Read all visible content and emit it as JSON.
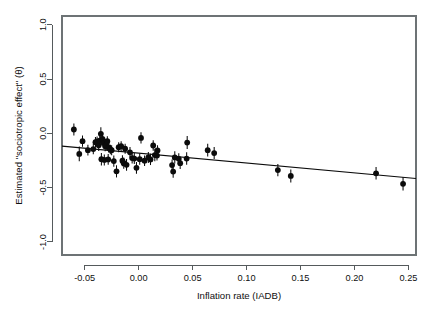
{
  "chart_data": {
    "type": "scatter",
    "title": "",
    "xlabel": "Inflation rate (IADB)",
    "ylabel": "Estimated \"sociotropic effect\" (θ)",
    "xlim": [
      -0.071,
      0.257
    ],
    "ylim": [
      -1.12,
      1.08
    ],
    "xticks": [
      -0.05,
      0.0,
      0.05,
      0.1,
      0.15,
      0.2,
      0.25
    ],
    "xtick_labels": [
      "-0.05",
      "0.00",
      "0.05",
      "0.10",
      "0.15",
      "0.20",
      "0.25"
    ],
    "yticks": [
      -1.0,
      -0.5,
      0.0,
      0.5,
      1.0
    ],
    "ytick_labels": [
      "-1.0",
      "-0.5",
      "0.0",
      "0.5",
      "1.0"
    ],
    "grid": false,
    "legend": "none",
    "point_color": "#0b0b0b",
    "line_color": "#0b0b0b",
    "frame_color": "#6d7375",
    "error_bars": "vertical",
    "fit_line": {
      "type": "linear",
      "x_start": -0.071,
      "y_start": -0.118,
      "x_end": 0.257,
      "y_end": -0.415,
      "slope": -0.905,
      "intercept": -0.182
    },
    "points": [
      {
        "x": -0.06,
        "y": 0.035,
        "err": 0.055
      },
      {
        "x": -0.055,
        "y": -0.19,
        "err": 0.068
      },
      {
        "x": -0.052,
        "y": -0.072,
        "err": 0.052
      },
      {
        "x": -0.047,
        "y": -0.155,
        "err": 0.05
      },
      {
        "x": -0.042,
        "y": -0.145,
        "err": 0.048
      },
      {
        "x": -0.04,
        "y": -0.082,
        "err": 0.048
      },
      {
        "x": -0.0385,
        "y": -0.075,
        "err": 0.045
      },
      {
        "x": -0.037,
        "y": -0.11,
        "err": 0.052
      },
      {
        "x": -0.036,
        "y": -0.068,
        "err": 0.05
      },
      {
        "x": -0.035,
        "y": -0.005,
        "err": 0.062
      },
      {
        "x": -0.0345,
        "y": -0.238,
        "err": 0.058
      },
      {
        "x": -0.0335,
        "y": -0.052,
        "err": 0.046
      },
      {
        "x": -0.0325,
        "y": -0.09,
        "err": 0.046
      },
      {
        "x": -0.0318,
        "y": -0.245,
        "err": 0.05
      },
      {
        "x": -0.031,
        "y": -0.118,
        "err": 0.046
      },
      {
        "x": -0.03,
        "y": -0.108,
        "err": 0.048
      },
      {
        "x": -0.029,
        "y": -0.072,
        "err": 0.044
      },
      {
        "x": -0.0282,
        "y": -0.24,
        "err": 0.05
      },
      {
        "x": -0.0275,
        "y": -0.132,
        "err": 0.046
      },
      {
        "x": -0.0262,
        "y": -0.148,
        "err": 0.044
      },
      {
        "x": -0.025,
        "y": -0.155,
        "err": 0.046
      },
      {
        "x": -0.023,
        "y": -0.255,
        "err": 0.052
      },
      {
        "x": -0.0205,
        "y": -0.35,
        "err": 0.056
      },
      {
        "x": -0.0185,
        "y": -0.128,
        "err": 0.046
      },
      {
        "x": -0.0162,
        "y": -0.118,
        "err": 0.046
      },
      {
        "x": -0.015,
        "y": -0.252,
        "err": 0.05
      },
      {
        "x": -0.0138,
        "y": -0.275,
        "err": 0.052
      },
      {
        "x": -0.0125,
        "y": -0.142,
        "err": 0.046
      },
      {
        "x": -0.0112,
        "y": -0.29,
        "err": 0.054
      },
      {
        "x": -0.008,
        "y": -0.175,
        "err": 0.048
      },
      {
        "x": -0.006,
        "y": -0.228,
        "err": 0.05
      },
      {
        "x": -0.004,
        "y": -0.232,
        "err": 0.05
      },
      {
        "x": -0.002,
        "y": -0.318,
        "err": 0.054
      },
      {
        "x": 0.001,
        "y": -0.238,
        "err": 0.052
      },
      {
        "x": 0.0022,
        "y": -0.042,
        "err": 0.052
      },
      {
        "x": 0.0055,
        "y": -0.252,
        "err": 0.048
      },
      {
        "x": 0.009,
        "y": -0.222,
        "err": 0.05
      },
      {
        "x": 0.011,
        "y": -0.24,
        "err": 0.052
      },
      {
        "x": 0.0135,
        "y": -0.112,
        "err": 0.048
      },
      {
        "x": 0.015,
        "y": -0.2,
        "err": 0.058
      },
      {
        "x": 0.017,
        "y": -0.205,
        "err": 0.046
      },
      {
        "x": 0.0175,
        "y": -0.158,
        "err": 0.048
      },
      {
        "x": 0.031,
        "y": -0.292,
        "err": 0.052
      },
      {
        "x": 0.032,
        "y": -0.352,
        "err": 0.056
      },
      {
        "x": 0.0335,
        "y": -0.222,
        "err": 0.056
      },
      {
        "x": 0.0372,
        "y": -0.235,
        "err": 0.052
      },
      {
        "x": 0.0385,
        "y": -0.275,
        "err": 0.054
      },
      {
        "x": 0.0445,
        "y": -0.232,
        "err": 0.058
      },
      {
        "x": 0.045,
        "y": -0.085,
        "err": 0.06
      },
      {
        "x": 0.064,
        "y": -0.155,
        "err": 0.058
      },
      {
        "x": 0.07,
        "y": -0.182,
        "err": 0.055
      },
      {
        "x": 0.129,
        "y": -0.338,
        "err": 0.056
      },
      {
        "x": 0.141,
        "y": -0.392,
        "err": 0.06
      },
      {
        "x": 0.22,
        "y": -0.368,
        "err": 0.058
      },
      {
        "x": 0.245,
        "y": -0.465,
        "err": 0.062
      }
    ]
  },
  "plot_geometry": {
    "left": 62,
    "right": 416,
    "top": 16,
    "bottom": 255
  }
}
